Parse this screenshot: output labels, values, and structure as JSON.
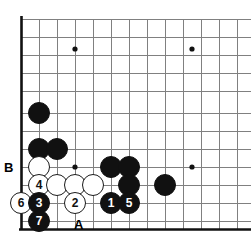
{
  "diagram": {
    "kind": "go-board-diagram",
    "board": {
      "left_edge_x": 21,
      "bottom_edge_y": 229,
      "top_line_y": 19,
      "spacing": 18,
      "columns_x": [
        21,
        39,
        57,
        75,
        93,
        111,
        129,
        147,
        165,
        183,
        201,
        219,
        237
      ],
      "rows_y": [
        19,
        37,
        55,
        73,
        91,
        113,
        131,
        149,
        167,
        185,
        203,
        221,
        229
      ],
      "edge_line_color": "#111111",
      "grid_line_color": "#808080",
      "background_color": "#ffffff"
    },
    "star_points": [
      {
        "name": "star-point-upper-left",
        "x": 75,
        "y": 49
      },
      {
        "name": "star-point-upper-right",
        "x": 192,
        "y": 49
      },
      {
        "name": "star-point-lower-left",
        "x": 75,
        "y": 167
      },
      {
        "name": "star-point-lower-right",
        "x": 192,
        "y": 167
      }
    ],
    "stones": [
      {
        "id": "black-stone-upper-left",
        "color": "black",
        "label": "",
        "x": 39,
        "y": 113,
        "r": 11
      },
      {
        "id": "black-stone-left-a",
        "color": "black",
        "label": "",
        "x": 39,
        "y": 149,
        "r": 11
      },
      {
        "id": "black-stone-left-b",
        "color": "black",
        "label": "",
        "x": 57,
        "y": 149,
        "r": 11
      },
      {
        "id": "white-stone-b-point",
        "color": "white",
        "label": "",
        "x": 39,
        "y": 167,
        "r": 11
      },
      {
        "id": "black-stone-center-a",
        "color": "black",
        "label": "",
        "x": 111,
        "y": 167,
        "r": 11
      },
      {
        "id": "black-stone-center-b",
        "color": "black",
        "label": "",
        "x": 129,
        "y": 167,
        "r": 11
      },
      {
        "id": "white-stone-move-4",
        "color": "white",
        "label": "4",
        "x": 39,
        "y": 185,
        "r": 11
      },
      {
        "id": "white-stone-mid-a",
        "color": "white",
        "label": "",
        "x": 57,
        "y": 185,
        "r": 11
      },
      {
        "id": "white-stone-mid-b",
        "color": "white",
        "label": "",
        "x": 75,
        "y": 185,
        "r": 11
      },
      {
        "id": "white-stone-mid-c",
        "color": "white",
        "label": "",
        "x": 93,
        "y": 185,
        "r": 11
      },
      {
        "id": "black-stone-mid-right",
        "color": "black",
        "label": "",
        "x": 129,
        "y": 185,
        "r": 11
      },
      {
        "id": "black-stone-right-side",
        "color": "black",
        "label": "",
        "x": 165,
        "y": 185,
        "r": 11
      },
      {
        "id": "white-stone-move-6",
        "color": "white",
        "label": "6",
        "x": 21,
        "y": 203,
        "r": 11
      },
      {
        "id": "black-stone-move-3",
        "color": "black",
        "label": "3",
        "x": 39,
        "y": 203,
        "r": 11
      },
      {
        "id": "white-stone-move-2",
        "color": "white",
        "label": "2",
        "x": 75,
        "y": 203,
        "r": 11
      },
      {
        "id": "black-stone-move-1",
        "color": "black",
        "label": "1",
        "x": 111,
        "y": 203,
        "r": 11
      },
      {
        "id": "black-stone-move-5",
        "color": "black",
        "label": "5",
        "x": 129,
        "y": 203,
        "r": 11
      },
      {
        "id": "black-stone-move-7",
        "color": "black",
        "label": "7",
        "x": 39,
        "y": 221,
        "r": 11
      }
    ],
    "move_numbers": [
      "1",
      "2",
      "3",
      "4",
      "5",
      "6",
      "7"
    ],
    "point_labels": [
      {
        "id": "point-label-b",
        "text": "B",
        "x": 8,
        "y": 167
      },
      {
        "id": "point-label-a",
        "text": "A",
        "x": 78,
        "y": 224
      }
    ]
  }
}
